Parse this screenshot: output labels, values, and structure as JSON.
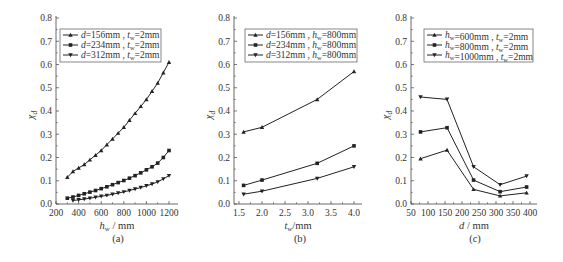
{
  "chart_data": [
    {
      "id": "a",
      "type": "line",
      "caption": "(a)",
      "xlabel": "h_w / mm",
      "ylabel": "χ_d",
      "xlim": [
        200,
        1250
      ],
      "ylim": [
        0,
        0.8
      ],
      "xticks": [
        200,
        400,
        600,
        800,
        1000,
        1200
      ],
      "yticks": [
        0.0,
        0.1,
        0.2,
        0.3,
        0.4,
        0.5,
        0.6,
        0.7,
        0.8
      ],
      "ytick_labels": [
        "0.0",
        "0.1",
        "0.2",
        "0.3",
        "0.4",
        "0.5",
        "0.6",
        "0.7",
        "0.8"
      ],
      "grid": false,
      "legend_position": "upper left",
      "series": [
        {
          "name": "d=156mm, t_w=2mm",
          "legend_pre": "d",
          "legend_mid": "=156mm , t",
          "legend_sub": "w",
          "legend_post": "=2mm",
          "marker": "triangle-up",
          "x": [
            300,
            350,
            400,
            450,
            500,
            550,
            600,
            650,
            700,
            750,
            800,
            850,
            900,
            950,
            1000,
            1050,
            1100,
            1150,
            1200
          ],
          "y": [
            0.115,
            0.14,
            0.155,
            0.17,
            0.19,
            0.21,
            0.23,
            0.255,
            0.28,
            0.305,
            0.33,
            0.36,
            0.39,
            0.42,
            0.45,
            0.485,
            0.52,
            0.565,
            0.61
          ]
        },
        {
          "name": "d=234mm, t_w=2mm",
          "legend_pre": "d",
          "legend_mid": "=234mm , t",
          "legend_sub": "w",
          "legend_post": "=2mm",
          "marker": "square",
          "x": [
            300,
            350,
            400,
            450,
            500,
            550,
            600,
            650,
            700,
            750,
            800,
            850,
            900,
            950,
            1000,
            1050,
            1100,
            1150,
            1200
          ],
          "y": [
            0.025,
            0.03,
            0.037,
            0.044,
            0.051,
            0.058,
            0.066,
            0.074,
            0.083,
            0.092,
            0.101,
            0.111,
            0.122,
            0.134,
            0.147,
            0.16,
            0.176,
            0.2,
            0.23
          ]
        },
        {
          "name": "d=312mm, t_w=2mm",
          "legend_pre": "d",
          "legend_mid": "=312mm , t",
          "legend_sub": "w",
          "legend_post": "=2mm",
          "marker": "triangle-down",
          "x": [
            350,
            400,
            450,
            500,
            550,
            600,
            650,
            700,
            750,
            800,
            850,
            900,
            950,
            1000,
            1050,
            1100,
            1150,
            1200
          ],
          "y": [
            0.015,
            0.018,
            0.021,
            0.025,
            0.029,
            0.033,
            0.037,
            0.042,
            0.047,
            0.052,
            0.058,
            0.064,
            0.071,
            0.078,
            0.086,
            0.095,
            0.108,
            0.122
          ]
        }
      ]
    },
    {
      "id": "b",
      "type": "line",
      "caption": "(b)",
      "xlabel": "t_w/mm",
      "ylabel": "χ_d",
      "xlim": [
        1.4,
        4.2
      ],
      "ylim": [
        0,
        0.8
      ],
      "xticks": [
        1.5,
        2.0,
        2.5,
        3.0,
        3.5,
        4.0
      ],
      "xtick_labels": [
        "1.5",
        "2.0",
        "2.5",
        "3.0",
        "3.5",
        "4.0"
      ],
      "yticks": [
        0.0,
        0.1,
        0.2,
        0.3,
        0.4,
        0.5,
        0.6,
        0.7,
        0.8
      ],
      "ytick_labels": [
        "0.0",
        "0.1",
        "0.2",
        "0.3",
        "0.4",
        "0.5",
        "0.6",
        "0.7",
        "0.8"
      ],
      "grid": false,
      "legend_position": "upper left",
      "series": [
        {
          "name": "d=156mm, h_w=800mm",
          "legend_pre": "d",
          "legend_mid": "=156mm , h",
          "legend_sub": "w",
          "legend_post": "=800mm",
          "marker": "triangle-up",
          "x": [
            1.6,
            2.0,
            3.2,
            4.0
          ],
          "y": [
            0.31,
            0.33,
            0.45,
            0.57
          ]
        },
        {
          "name": "d=234mm, h_w=800mm",
          "legend_pre": "d",
          "legend_mid": "=234mm , h",
          "legend_sub": "w",
          "legend_post": "=800mm",
          "marker": "square",
          "x": [
            1.6,
            2.0,
            3.2,
            4.0
          ],
          "y": [
            0.08,
            0.103,
            0.175,
            0.25
          ]
        },
        {
          "name": "d=312mm, h_w=800mm",
          "legend_pre": "d",
          "legend_mid": "=312mm , h",
          "legend_sub": "w",
          "legend_post": "=800mm",
          "marker": "triangle-down",
          "x": [
            1.6,
            2.0,
            3.2,
            4.0
          ],
          "y": [
            0.042,
            0.055,
            0.11,
            0.16
          ]
        }
      ]
    },
    {
      "id": "c",
      "type": "line",
      "caption": "(c)",
      "xlabel": "d / mm",
      "ylabel": "χ_d",
      "xlim": [
        50,
        410
      ],
      "ylim": [
        0,
        0.8
      ],
      "xticks": [
        50,
        100,
        150,
        200,
        250,
        300,
        350,
        400
      ],
      "yticks": [
        0.0,
        0.1,
        0.2,
        0.3,
        0.4,
        0.5,
        0.6,
        0.7,
        0.8
      ],
      "ytick_labels": [
        "0.0",
        "0.1",
        "0.2",
        "0.3",
        "0.4",
        "0.5",
        "0.6",
        "0.7",
        "0.8"
      ],
      "grid": false,
      "legend_position": "upper left",
      "series": [
        {
          "name": "h_w=600mm, t_w=2mm",
          "legend_pre": "h",
          "legend_sub1": "w",
          "legend_mid": "=600mm , t",
          "legend_sub": "w",
          "legend_post": "=2mm",
          "marker": "triangle-up",
          "x": [
            78,
            156,
            234,
            312,
            390
          ],
          "y": [
            0.195,
            0.232,
            0.063,
            0.035,
            0.048
          ]
        },
        {
          "name": "h_w=800mm, t_w=2mm",
          "legend_pre": "h",
          "legend_sub1": "w",
          "legend_mid": "=800mm , t",
          "legend_sub": "w",
          "legend_post": "=2mm",
          "marker": "square",
          "x": [
            78,
            156,
            234,
            312,
            390
          ],
          "y": [
            0.31,
            0.328,
            0.103,
            0.053,
            0.073
          ]
        },
        {
          "name": "h_w=1000mm, t_w=2mm",
          "legend_pre": "h",
          "legend_sub1": "w",
          "legend_mid": "=1000mm , t",
          "legend_sub": "w",
          "legend_post": "=2mm",
          "marker": "triangle-down",
          "x": [
            78,
            156,
            234,
            312,
            390
          ],
          "y": [
            0.46,
            0.45,
            0.16,
            0.083,
            0.12
          ]
        }
      ]
    }
  ]
}
